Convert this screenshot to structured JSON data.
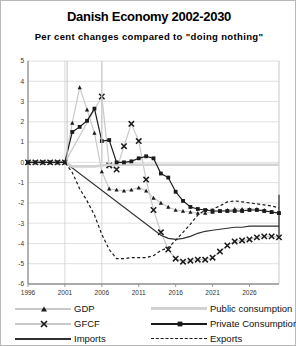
{
  "title": "Danish Economy 2002-2030",
  "subtitle": "Per cent changes compared to \"doing nothing\"",
  "legend": {
    "items": [
      {
        "label": "GDP",
        "style": "gray-line-triangle",
        "marker": "triangle",
        "color": "#c9c9c9"
      },
      {
        "label": "GFCF",
        "style": "gray-line-x",
        "marker": "x",
        "color": "#c9c9c9"
      },
      {
        "label": "Imports",
        "style": "dark-line",
        "marker": "none",
        "color": "#303030"
      },
      {
        "label": "Public consumption",
        "style": "light-gray-line",
        "marker": "none",
        "color": "#d2d2d2"
      },
      {
        "label": "Private Consumption",
        "style": "dark-line-square",
        "marker": "square",
        "color": "#1a1a1a"
      },
      {
        "label": "Exports",
        "style": "dotted-line",
        "marker": "none",
        "color": "#1a1a1a"
      }
    ]
  },
  "chart_data": {
    "type": "line",
    "title": "Danish Economy 2002-2030",
    "subtitle": "Per cent changes compared to \"doing nothing\"",
    "xlabel": "",
    "ylabel": "",
    "xlim": [
      1996,
      2030
    ],
    "ylim": [
      -6,
      5
    ],
    "yticks": [
      5,
      4,
      3,
      2,
      1,
      0,
      -1,
      -2,
      -3,
      -4,
      -5,
      -6
    ],
    "xticks": [
      1996,
      2001,
      2006,
      2011,
      2016,
      2021,
      2026
    ],
    "grid": "horizontal",
    "legend_position": "bottom",
    "x": [
      1996,
      1997,
      1998,
      1999,
      2000,
      2001,
      2002,
      2003,
      2004,
      2005,
      2006,
      2007,
      2008,
      2009,
      2010,
      2011,
      2012,
      2013,
      2014,
      2015,
      2016,
      2017,
      2018,
      2019,
      2020,
      2021,
      2022,
      2023,
      2024,
      2025,
      2026,
      2027,
      2028,
      2029,
      2030
    ],
    "series": [
      {
        "name": "GDP",
        "color": "#c9c9c9",
        "marker": "triangle",
        "values": [
          0,
          0,
          0,
          0,
          0,
          0,
          1.95,
          3.7,
          2.6,
          1.45,
          -0.45,
          -1.3,
          -1.35,
          -1.4,
          -1.35,
          -1.25,
          -1.4,
          -1.75,
          -2.0,
          -2.2,
          -2.35,
          -2.4,
          -2.45,
          -2.5,
          -2.5,
          -2.45,
          -2.4,
          -2.35,
          -2.3,
          -2.3,
          -2.3,
          -2.3,
          -2.35,
          -2.45,
          -2.5
        ]
      },
      {
        "name": "GFCF",
        "color": "#c9c9c9",
        "marker": "x",
        "values": [
          0,
          0,
          0,
          0,
          0,
          0,
          null,
          null,
          null,
          null,
          3.25,
          -0.15,
          -0.35,
          0.8,
          1.9,
          1.05,
          -0.85,
          -2.35,
          -3.45,
          -4.3,
          -4.75,
          -4.9,
          -4.85,
          -4.8,
          -4.8,
          -4.7,
          -4.4,
          -4.1,
          -3.9,
          -3.85,
          -3.8,
          -3.7,
          -3.65,
          -3.65,
          -3.7
        ]
      },
      {
        "name": "Imports",
        "color": "#303030",
        "marker": "none",
        "values": [
          0,
          0,
          0,
          0,
          0,
          0,
          null,
          null,
          null,
          null,
          null,
          null,
          null,
          null,
          null,
          null,
          null,
          null,
          -3.6,
          -3.75,
          -3.8,
          -3.75,
          -3.65,
          -3.5,
          -3.4,
          -3.35,
          -3.3,
          -3.25,
          -3.2,
          -3.2,
          -3.15,
          -3.15,
          -3.15,
          -3.15,
          -3.15
        ]
      },
      {
        "name": "Public consumption",
        "color": "#d2d2d2",
        "marker": "none",
        "values": [
          0,
          0,
          0,
          0,
          0,
          0,
          -0.2,
          -0.2,
          -0.2,
          -0.2,
          -0.15,
          -0.12,
          -0.12,
          -0.12,
          -0.12,
          -0.12,
          -0.12,
          -0.12,
          -0.12,
          -0.12,
          -0.12,
          -0.12,
          -0.12,
          -0.12,
          -0.12,
          -0.12,
          -0.12,
          -0.12,
          -0.12,
          -0.12,
          -0.12,
          -0.12,
          -0.12,
          -0.12,
          -0.12
        ]
      },
      {
        "name": "Private Consumption",
        "color": "#1a1a1a",
        "marker": "square",
        "values": [
          0,
          0,
          0,
          0,
          0,
          0,
          1.5,
          1.75,
          2.05,
          2.65,
          1.05,
          1.1,
          0.0,
          0.0,
          0.05,
          0.2,
          0.3,
          0.2,
          -0.55,
          -0.75,
          -1.45,
          -1.9,
          -2.2,
          -2.3,
          -2.35,
          -2.4,
          -2.4,
          -2.4,
          -2.4,
          -2.4,
          -2.35,
          -2.35,
          -2.4,
          -2.45,
          -2.5
        ]
      },
      {
        "name": "Exports",
        "color": "#1a1a1a",
        "marker": "none",
        "values": [
          0,
          0,
          0,
          0,
          0,
          0,
          -0.5,
          -1.3,
          -1.9,
          -2.6,
          -3.55,
          -4.3,
          -4.75,
          -4.75,
          -4.7,
          -4.7,
          -4.7,
          -4.6,
          -4.35,
          -4.2,
          -3.85,
          -3.45,
          -3.05,
          -2.6,
          -2.35,
          -2.3,
          -2.15,
          -1.95,
          -1.9,
          -1.95,
          -2.0,
          -2.05,
          -2.1,
          -2.15,
          -2.25
        ]
      }
    ]
  }
}
